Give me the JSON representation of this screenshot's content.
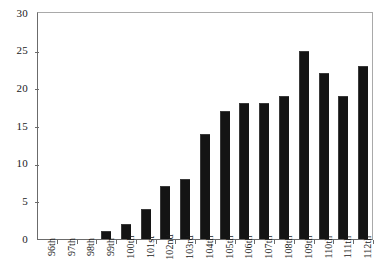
{
  "chart_data": {
    "type": "bar",
    "title": "",
    "subtitle": "",
    "xlabel": "",
    "ylabel": "",
    "categories": [
      "96th",
      "97th",
      "98th",
      "99th",
      "100th",
      "101st",
      "102nd",
      "103rd",
      "104th",
      "105th",
      "106th",
      "107th",
      "108th",
      "109th",
      "110th",
      "111th",
      "112th"
    ],
    "values": [
      0,
      0,
      0,
      1,
      2,
      4,
      7,
      8,
      14,
      17,
      18,
      18,
      19,
      25,
      22,
      19,
      23
    ],
    "series": [
      {
        "name": "",
        "values": [
          0,
          0,
          0,
          1,
          2,
          4,
          7,
          8,
          14,
          17,
          18,
          18,
          19,
          25,
          22,
          19,
          23
        ]
      }
    ],
    "ylim": [
      0,
      30
    ],
    "yticks": [
      0,
      5,
      10,
      15,
      20,
      25,
      30
    ],
    "ytick_labels": [
      "0",
      "5",
      "10",
      "15",
      "20",
      "25",
      "30"
    ],
    "grid": false,
    "legend": false,
    "legend_position": "none",
    "bar_color": "#141414",
    "axis_color": "#6b6b6b",
    "plot_background": "#ffffff",
    "annotations": []
  }
}
